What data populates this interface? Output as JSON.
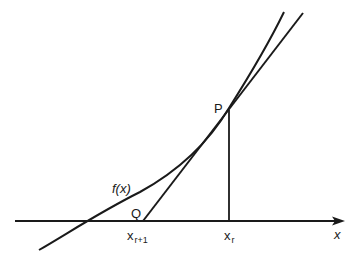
{
  "diagram": {
    "colors": {
      "stroke": "#1a1a1a",
      "background": "#ffffff"
    },
    "labels": {
      "curve": "f(x)",
      "point_p": "P",
      "point_q": "Q",
      "x_next_base": "x",
      "x_next_sub": "r+1",
      "x_curr_base": "x",
      "x_curr_sub": "r",
      "x_axis": "x"
    },
    "elements": [
      {
        "name": "x-axis",
        "type": "arrow",
        "from": [
          15,
          221
        ],
        "to": [
          344,
          221
        ]
      },
      {
        "name": "curve-f",
        "type": "curve",
        "points": [
          [
            39,
            250
          ],
          [
            90,
            221
          ],
          [
            229,
            107
          ],
          [
            284,
            12
          ]
        ]
      },
      {
        "name": "tangent-line",
        "type": "line",
        "from": [
          143,
          221
        ],
        "to": [
          303,
          13
        ]
      },
      {
        "name": "ordinate-line",
        "type": "line",
        "from": [
          229,
          110
        ],
        "to": [
          229,
          221
        ]
      }
    ]
  }
}
